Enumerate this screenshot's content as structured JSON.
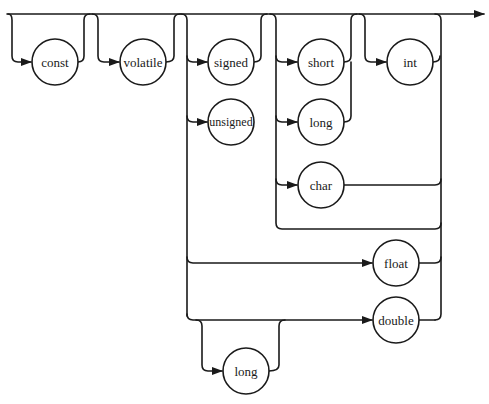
{
  "diagram": {
    "type": "syntax-railroad-diagram",
    "stroke_color": "#1a1a1a",
    "background": "#ffffff",
    "nodes": [
      {
        "id": "const",
        "label": "const",
        "cx": 55,
        "cy": 62
      },
      {
        "id": "volatile",
        "label": "volatile",
        "cx": 143,
        "cy": 62
      },
      {
        "id": "signed",
        "label": "signed",
        "cx": 231,
        "cy": 62
      },
      {
        "id": "unsigned",
        "label": "unsigned",
        "cx": 231,
        "cy": 122
      },
      {
        "id": "short",
        "label": "short",
        "cx": 321,
        "cy": 62
      },
      {
        "id": "long1",
        "label": "long",
        "cx": 321,
        "cy": 122
      },
      {
        "id": "char",
        "label": "char",
        "cx": 321,
        "cy": 185
      },
      {
        "id": "int",
        "label": "int",
        "cx": 410,
        "cy": 62
      },
      {
        "id": "float",
        "label": "float",
        "cx": 396,
        "cy": 263
      },
      {
        "id": "double",
        "label": "double",
        "cx": 396,
        "cy": 320
      },
      {
        "id": "long2",
        "label": "long",
        "cx": 246,
        "cy": 371
      }
    ],
    "node_radius": 23,
    "groups": [
      {
        "name": "optional-const",
        "items": [
          "const"
        ]
      },
      {
        "name": "optional-volatile",
        "items": [
          "volatile"
        ]
      },
      {
        "name": "optional-sign",
        "items": [
          "signed",
          "unsigned"
        ]
      },
      {
        "name": "integer-size",
        "items": [
          "short",
          "long",
          "char"
        ]
      },
      {
        "name": "optional-int",
        "items": [
          "int"
        ]
      },
      {
        "name": "float-type",
        "items": [
          "float"
        ]
      },
      {
        "name": "double-type",
        "items": [
          "long (optional)",
          "double"
        ]
      }
    ]
  }
}
